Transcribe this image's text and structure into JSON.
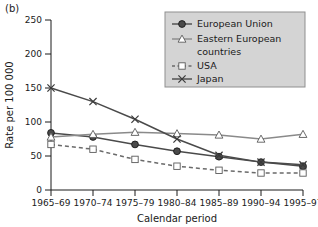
{
  "panel_label": "(b)",
  "chart_data": {
    "type": "line",
    "title": "",
    "xlabel": "Calendar period",
    "ylabel": "Rate per 100 000",
    "categories": [
      "1965–69",
      "1970–74",
      "1975–79",
      "1980–84",
      "1985–89",
      "1990–94",
      "1995–97"
    ],
    "ylim": [
      0,
      250
    ],
    "yticks": [
      0,
      50,
      100,
      150,
      200,
      250
    ],
    "grid": false,
    "legend_position": "top-right",
    "series": [
      {
        "name": "European Union",
        "marker": "filled-circle",
        "line": "solid",
        "color": "#4a4a4a",
        "values": [
          84,
          78,
          67,
          57,
          49,
          41,
          35
        ]
      },
      {
        "name": "Eastern European countries",
        "marker": "open-triangle",
        "line": "solid",
        "color": "#8a8a8a",
        "values": [
          78,
          82,
          85,
          83,
          81,
          75,
          82
        ]
      },
      {
        "name": "USA",
        "marker": "open-square",
        "line": "dashed",
        "color": "#6a6a6a",
        "values": [
          67,
          60,
          45,
          35,
          29,
          25,
          25
        ]
      },
      {
        "name": "Japan",
        "marker": "cross",
        "line": "solid",
        "color": "#4a4a4a",
        "values": [
          150,
          130,
          104,
          75,
          51,
          41,
          37
        ]
      }
    ]
  },
  "legend": {
    "entries": [
      {
        "label": "European Union"
      },
      {
        "label": "Eastern European"
      },
      {
        "label": "countries"
      },
      {
        "label": "USA"
      },
      {
        "label": "Japan"
      }
    ]
  },
  "colors": {
    "axis": "#1a1a1a",
    "legend_bg": "#d4d4d4",
    "legend_border": "#8f8f8f"
  }
}
